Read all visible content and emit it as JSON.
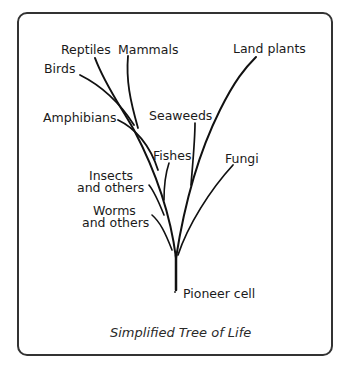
{
  "title": "Simplified Tree of Life",
  "root": "Pioneer cell",
  "branches": {
    "reptiles": "Reptiles",
    "mammals": "Mammals",
    "birds": "Birds",
    "land_plants": "Land plants",
    "amphibians": "Amphibians",
    "seaweeds": "Seaweeds",
    "fishes": "Fishes",
    "fungi": "Fungi",
    "insects_1": "Insects",
    "insects_2": "and others",
    "worms_1": "Worms",
    "worms_2": "and others"
  }
}
